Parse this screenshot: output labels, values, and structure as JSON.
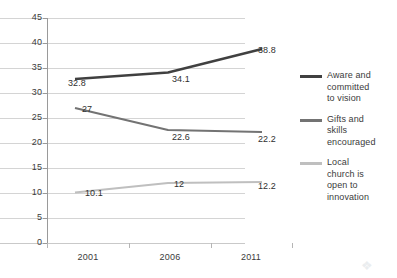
{
  "chart_data": {
    "type": "line",
    "title": "",
    "xlabel": "",
    "ylabel": "",
    "categories": [
      "2001",
      "2006",
      "2011"
    ],
    "ylim": [
      0,
      45
    ],
    "yticks": [
      0,
      5,
      10,
      15,
      20,
      25,
      30,
      35,
      40,
      45
    ],
    "ytick_labels": [
      "0",
      "5",
      "10",
      "15",
      "20",
      "25",
      "30",
      "35",
      "40",
      "45"
    ],
    "grid": true,
    "legend_position": "right",
    "series": [
      {
        "name": "Aware and committed to vision",
        "legend_lines": [
          "Aware and",
          "committed",
          "to vision"
        ],
        "color": "#404040",
        "values": [
          32.8,
          34.1,
          38.8
        ],
        "labels": [
          "32.8",
          "34.1",
          "38.8"
        ]
      },
      {
        "name": "Gifts and skills encouraged",
        "legend_lines": [
          "Gifts and",
          "skills",
          "encouraged"
        ],
        "color": "#737373",
        "values": [
          27,
          22.6,
          22.2
        ],
        "labels": [
          "27",
          "22.6",
          "22.2"
        ]
      },
      {
        "name": "Local church is open to innovation",
        "legend_lines": [
          "Local",
          "church is",
          "open to",
          "innovation"
        ],
        "color": "#bfbfbf",
        "values": [
          10.1,
          12,
          12.2
        ],
        "labels": [
          "10.1",
          "12",
          "12.2"
        ]
      }
    ]
  }
}
